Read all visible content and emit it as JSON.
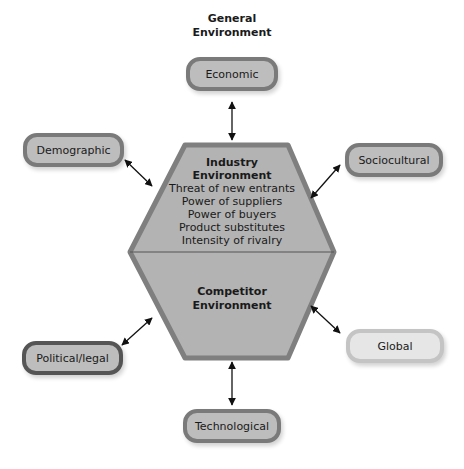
{
  "title": {
    "line1": "General",
    "line2": "Environment"
  },
  "nodes": {
    "economic": "Economic",
    "demographic": "Demographic",
    "sociocultural": "Sociocultural",
    "political": "Political/legal",
    "global": "Global",
    "technological": "Technological"
  },
  "industry": {
    "head1": "Industry",
    "head2": "Environment",
    "items": [
      "Threat of new entrants",
      "Power of suppliers",
      "Power of buyers",
      "Product substitutes",
      "Intensity of rivalry"
    ]
  },
  "competitor": {
    "line1": "Competitor",
    "line2": "Environment"
  },
  "colors": {
    "hex_fill": "#b3b3b3",
    "hex_border": "#7f7f7f",
    "pill_fill": "#bdbdbd",
    "pill_border": "#7a7a7a"
  }
}
